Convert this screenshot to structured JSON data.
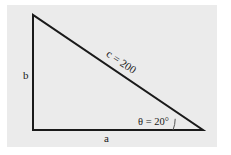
{
  "diagram": {
    "type": "right-triangle",
    "background_color": "#ebebeb",
    "line_color": "#1a1a1a",
    "labels": {
      "hypotenuse": "c = 200",
      "vertical_side": "b",
      "horizontal_side": "a",
      "angle": "θ = 20°"
    },
    "vertices": {
      "top": [
        32,
        15
      ],
      "right_angle": [
        33,
        130
      ],
      "acute_angle": [
        203,
        130
      ]
    }
  }
}
